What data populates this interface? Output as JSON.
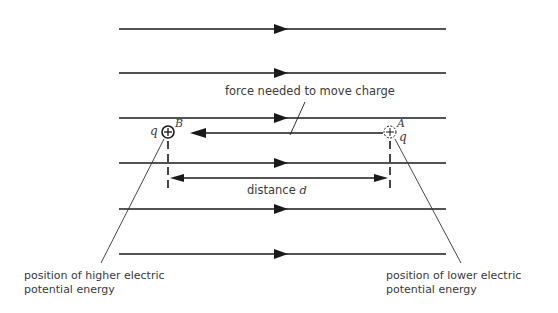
{
  "diagram": {
    "type": "uniform electric field with charge moved against field",
    "field_lines": {
      "count": 6,
      "direction": "left-to-right",
      "y_positions": [
        29,
        73,
        118,
        163,
        209,
        254
      ],
      "x_start": 119,
      "x_end": 446,
      "arrow_x": 283,
      "color": "#1a1a1a"
    },
    "labels": {
      "force": "force needed to move charge",
      "distance": "distance",
      "distance_var": "d",
      "point_b": "B",
      "point_a": "A",
      "charge_b": "q",
      "charge_a": "q",
      "higher_line1": "position of higher electric",
      "higher_line2": "potential energy",
      "lower_line1": "position of lower electric",
      "lower_line2": "potential energy"
    },
    "charges": [
      {
        "name": "B",
        "x": 168,
        "y": 132,
        "style": "solid",
        "sign": "+"
      },
      {
        "name": "A",
        "x": 390,
        "y": 132,
        "style": "dashed",
        "sign": "+"
      }
    ]
  }
}
